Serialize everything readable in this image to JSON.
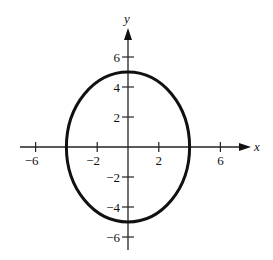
{
  "chart_data": {
    "type": "line",
    "title": "",
    "xlabel": "x",
    "ylabel": "y",
    "curve": {
      "shape": "ellipse",
      "equation": "x^2/16 + y^2/25 = 1",
      "center": [
        0,
        0
      ],
      "semi_axis_x": 4,
      "semi_axis_y": 5,
      "color": "#111111"
    },
    "x_ticks": [
      -6,
      -2,
      2,
      6
    ],
    "x_tick_labels": [
      "−6",
      "−2",
      "2",
      "6"
    ],
    "y_ticks": [
      6,
      4,
      2,
      -2,
      -4,
      -6
    ],
    "y_tick_labels": [
      "6",
      "4",
      "2",
      "−2",
      "−4",
      "−6"
    ],
    "xlim": [
      -7,
      8
    ],
    "ylim": [
      -7,
      8
    ],
    "grid": false,
    "legend": null
  }
}
